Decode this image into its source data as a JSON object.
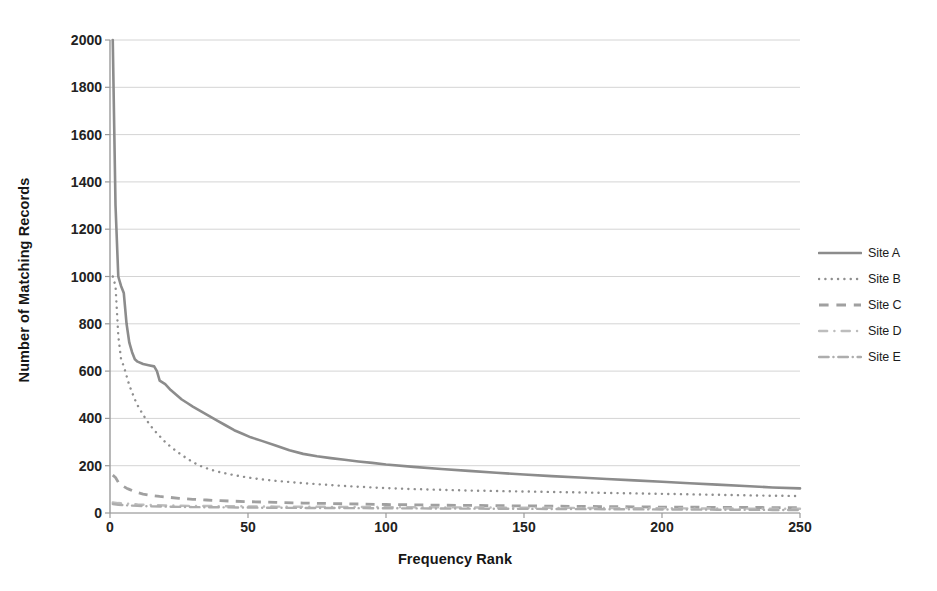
{
  "chart_data": {
    "type": "line",
    "title": "",
    "xlabel": "Frequency Rank",
    "ylabel": "Number of Matching Records",
    "xlim": [
      0,
      250
    ],
    "ylim": [
      0,
      2000
    ],
    "xticks": [
      0,
      50,
      100,
      150,
      200,
      250
    ],
    "yticks": [
      0,
      200,
      400,
      600,
      800,
      1000,
      1200,
      1400,
      1600,
      1800,
      2000
    ],
    "grid": "horizontal",
    "legend_position": "right",
    "series": [
      {
        "name": "Site A",
        "style": "solid",
        "color": "#8c8c8c",
        "x": [
          1,
          2,
          3,
          4,
          5,
          6,
          7,
          8,
          9,
          10,
          12,
          14,
          16,
          17,
          18,
          20,
          22,
          24,
          26,
          28,
          30,
          33,
          36,
          39,
          42,
          45,
          48,
          51,
          55,
          60,
          65,
          70,
          75,
          80,
          85,
          90,
          95,
          100,
          110,
          120,
          130,
          140,
          150,
          160,
          170,
          180,
          190,
          200,
          210,
          220,
          230,
          240,
          250
        ],
        "y": [
          2000,
          1300,
          1000,
          960,
          930,
          800,
          720,
          680,
          650,
          640,
          630,
          625,
          620,
          600,
          560,
          545,
          520,
          500,
          480,
          465,
          450,
          430,
          410,
          390,
          370,
          350,
          335,
          320,
          305,
          285,
          265,
          250,
          240,
          232,
          225,
          218,
          212,
          205,
          195,
          186,
          178,
          170,
          163,
          156,
          150,
          144,
          138,
          132,
          126,
          120,
          114,
          108,
          104
        ]
      },
      {
        "name": "Site B",
        "style": "dotted",
        "color": "#8f8f8f",
        "x": [
          1,
          2,
          3,
          4,
          5,
          6,
          7,
          8,
          9,
          10,
          12,
          14,
          16,
          18,
          20,
          22,
          24,
          26,
          28,
          30,
          33,
          36,
          40,
          45,
          50,
          55,
          60,
          65,
          70,
          75,
          80,
          85,
          90,
          95,
          100,
          110,
          120,
          130,
          140,
          150,
          160,
          170,
          180,
          190,
          200,
          210,
          220,
          230,
          240,
          250
        ],
        "y": [
          1000,
          960,
          750,
          650,
          620,
          580,
          540,
          510,
          480,
          455,
          415,
          380,
          350,
          325,
          300,
          280,
          262,
          245,
          230,
          215,
          198,
          185,
          172,
          160,
          150,
          142,
          136,
          131,
          126,
          122,
          118,
          114,
          111,
          108,
          105,
          101,
          98,
          95,
          93,
          91,
          89,
          87,
          85,
          83,
          81,
          79,
          77,
          75,
          73,
          72
        ]
      },
      {
        "name": "Site C",
        "style": "dashed",
        "color": "#a0a0a0",
        "x": [
          1,
          2,
          3,
          4,
          5,
          6,
          7,
          8,
          9,
          10,
          12,
          15,
          18,
          20,
          25,
          30,
          35,
          40,
          50,
          60,
          70,
          80,
          90,
          100,
          120,
          140,
          160,
          180,
          200,
          220,
          240,
          250
        ],
        "y": [
          160,
          150,
          130,
          120,
          112,
          105,
          100,
          95,
          90,
          86,
          80,
          74,
          70,
          68,
          62,
          58,
          55,
          52,
          48,
          45,
          42,
          40,
          38,
          36,
          33,
          31,
          29,
          27,
          25,
          24,
          23,
          22
        ]
      },
      {
        "name": "Site D",
        "style": "dashdot-light",
        "color": "#bdbdbd",
        "x": [
          1,
          3,
          5,
          8,
          10,
          15,
          20,
          30,
          40,
          50,
          60,
          80,
          100,
          120,
          140,
          160,
          180,
          200,
          220,
          240,
          250
        ],
        "y": [
          45,
          42,
          40,
          38,
          36,
          34,
          32,
          30,
          29,
          28,
          27,
          26,
          25,
          24,
          23,
          22,
          21,
          20,
          19,
          18,
          18
        ]
      },
      {
        "name": "Site E",
        "style": "dashdot",
        "color": "#adadad",
        "x": [
          1,
          3,
          5,
          8,
          10,
          15,
          20,
          30,
          40,
          50,
          60,
          80,
          100,
          120,
          140,
          160,
          180,
          200,
          220,
          240,
          250
        ],
        "y": [
          38,
          35,
          33,
          31,
          30,
          28,
          27,
          25,
          24,
          23,
          22,
          21,
          20,
          19,
          18,
          17,
          16,
          15,
          14,
          13,
          13
        ]
      }
    ]
  },
  "legend": {
    "items": [
      {
        "label": "Site A"
      },
      {
        "label": "Site B"
      },
      {
        "label": "Site C"
      },
      {
        "label": "Site D"
      },
      {
        "label": "Site E"
      }
    ]
  },
  "colors": {
    "grid": "#d4d4d4",
    "axis": "#9a9a9a",
    "text": "#1a1a1a",
    "background": "#ffffff"
  }
}
